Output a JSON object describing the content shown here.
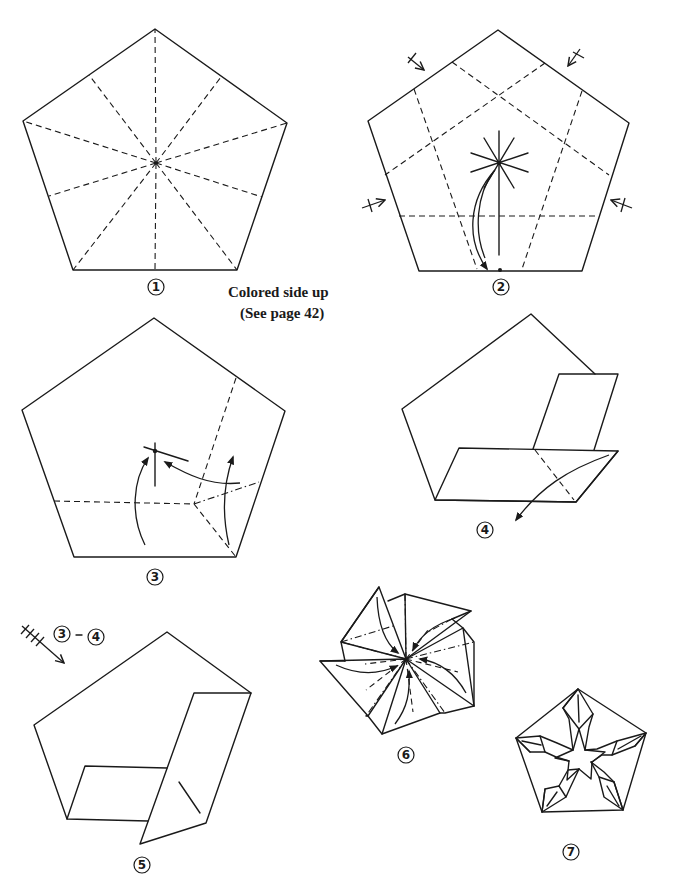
{
  "page": {
    "background": "#ffffff",
    "ink_color": "#1a1a1a"
  },
  "captions": {
    "line1": "Colored side up",
    "line2": "(See page 42)"
  },
  "steps": [
    {
      "number": "1",
      "label_pos": [
        160,
        286
      ],
      "description": "pentagon with valley creases from center to every vertex and edge midpoint"
    },
    {
      "number": "2",
      "label_pos": [
        502,
        287
      ],
      "description": "pentagon with five edge-parallel dashed creases, rotation symbols, and a fold arrow bringing center to bottom edge"
    },
    {
      "number": "3",
      "label_pos": [
        155,
        577
      ],
      "description": "pentagon with valley and mountain creases and three arrows toward a reference point"
    },
    {
      "number": "4",
      "label_pos": [
        486,
        529
      ],
      "description": "partially folded pentagon with two flaps, dashed crease and arrow pointing down-left"
    },
    {
      "number": "5",
      "label_pos": [
        141,
        866
      ],
      "description": "shape after repeating steps 3-4 on all sides"
    },
    {
      "number": "6",
      "label_pos": [
        406,
        755
      ],
      "description": "pinwheel form with five flaps and arrows pointing to center"
    },
    {
      "number": "7",
      "label_pos": [
        570,
        852
      ],
      "description": "finished star-in-pentagon model"
    }
  ],
  "repeat_note": {
    "from": "3",
    "to": "4",
    "symbol": "repeat-arrow-icon"
  }
}
